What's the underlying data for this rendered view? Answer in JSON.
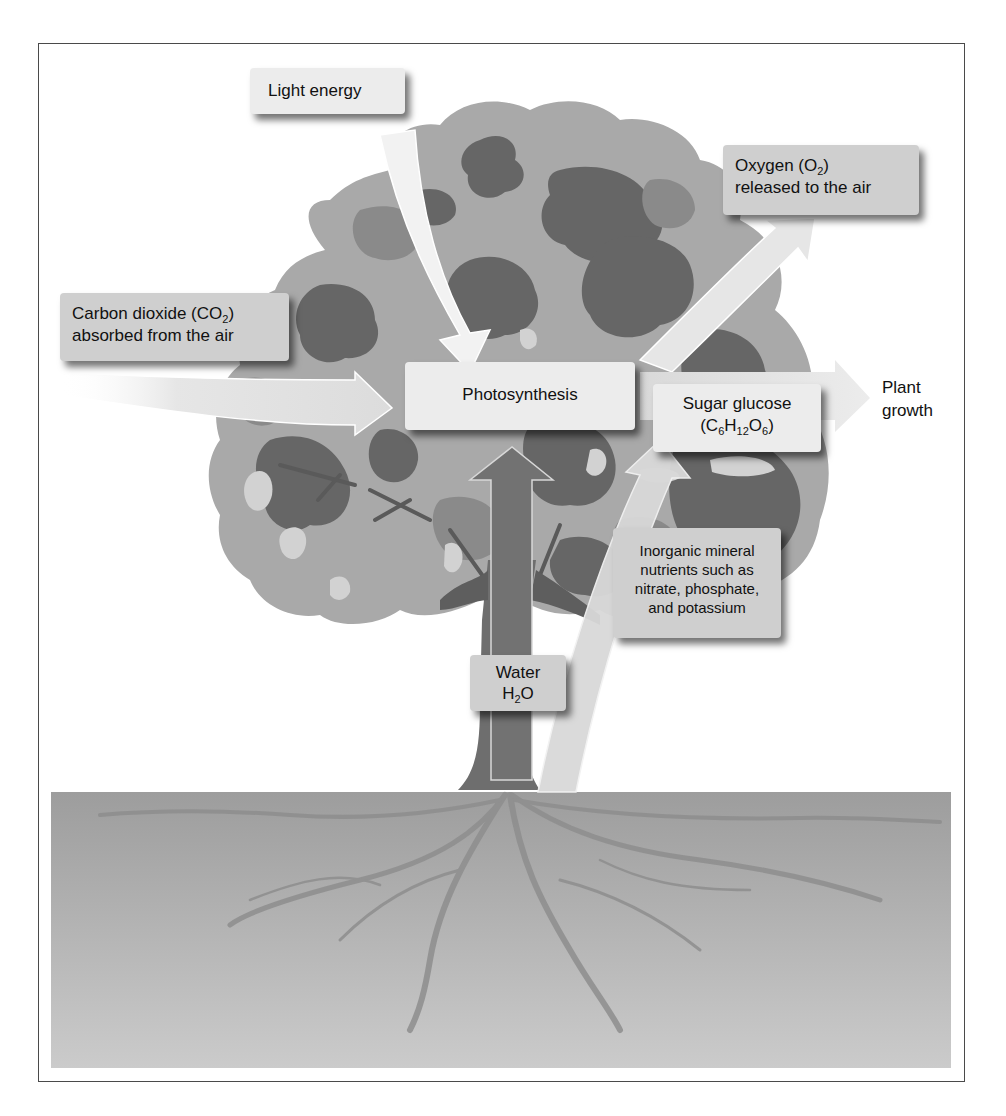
{
  "diagram": {
    "topic": "Photosynthesis in a tree",
    "colors": {
      "frame_border": "#4a4a4a",
      "canopy_light": "#a9a9a9",
      "canopy_mid": "#8a8a8a",
      "canopy_dark": "#666666",
      "canopy_highlight": "#d2d2d2",
      "trunk": "#6e6e6e",
      "arrow": "#e4e4e4",
      "ground_top": "#9d9d9d",
      "ground_bottom": "#cacaca",
      "label_light": "#ececec",
      "label_mid": "#cfcfcf"
    },
    "labels": {
      "light_energy": "Light energy",
      "oxygen": {
        "line1_prefix": "Oxygen (O",
        "line1_sub": "2",
        "line1_suffix": ")",
        "line2": "released to the air"
      },
      "carbon_dioxide": {
        "line1_prefix": "Carbon dioxide (CO",
        "line1_sub": "2",
        "line1_suffix": ")",
        "line2": "absorbed from the air"
      },
      "photosynthesis": "Photosynthesis",
      "sugar": {
        "line1": "Sugar glucose",
        "formula_open": "(C",
        "sub_c": "6",
        "h": "H",
        "sub_h": "12",
        "o": "O",
        "sub_o": "6",
        "formula_close": ")"
      },
      "plant_growth": {
        "line1": "Plant",
        "line2": "growth"
      },
      "nutrients": {
        "line1": "Inorganic mineral",
        "line2": "nutrients such as",
        "line3": "nitrate, phosphate,",
        "line4": "and potassium"
      },
      "water": {
        "line1": "Water",
        "line2_prefix": "H",
        "line2_sub": "2",
        "line2_suffix": "O"
      }
    }
  }
}
